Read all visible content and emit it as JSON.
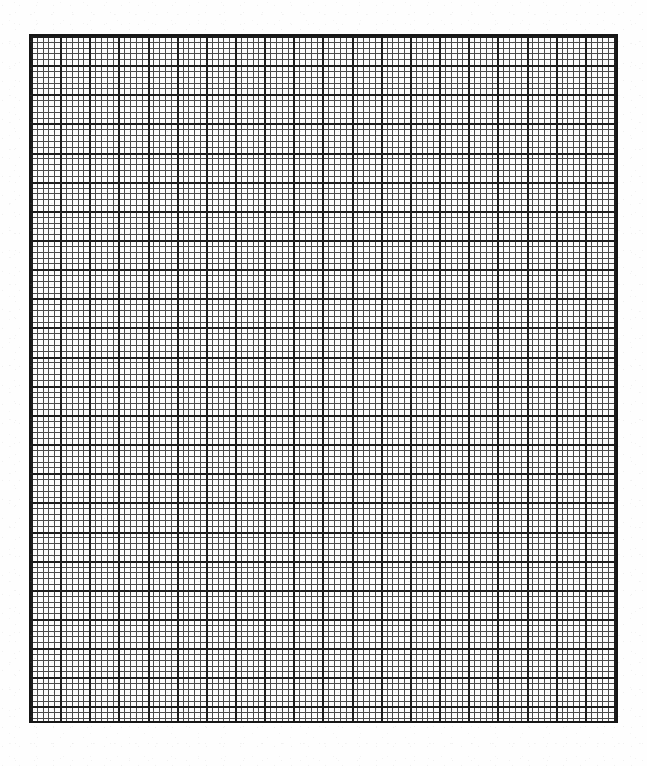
{
  "document": {
    "kind": "graph-paper-scan",
    "sheet_background_color": "#ffffff",
    "paper_tint_color": "#fbfbfb",
    "canvas_width": 647,
    "canvas_height": 766,
    "visible_text": ""
  },
  "grid": {
    "label": "graph paper grid",
    "left": 29,
    "top": 34,
    "right": 618,
    "bottom": 723,
    "width": 589,
    "height": 689,
    "minor_cell_px": 5.83,
    "major_cell_px": 29.15,
    "minor_per_major": 5,
    "minor_columns": 101,
    "minor_rows": 118,
    "major_columns": 20,
    "major_rows": 24,
    "minor_line_color": "#4a4a4a",
    "major_line_color": "#1c1c1c",
    "border_color": "#161616",
    "minor_line_width_px": 1,
    "major_line_width_px": 2,
    "border_width_px": 2,
    "cell_fill_color": "#fcfcfc",
    "orientation": "portrait"
  },
  "chart_data": {
    "type": "table",
    "title": "",
    "xlabel": "",
    "ylabel": "",
    "categories": [],
    "values": [],
    "grid": true,
    "legend": "none",
    "annotations": []
  }
}
